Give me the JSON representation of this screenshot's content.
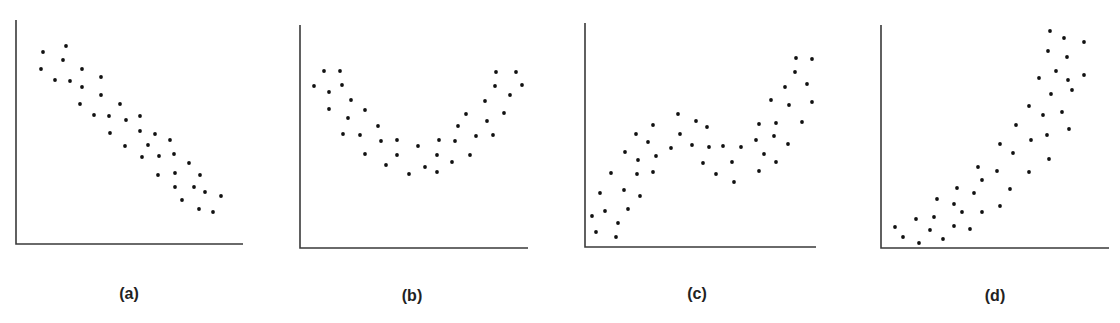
{
  "chart_data": [
    {
      "type": "scatter",
      "id": "a",
      "title": "",
      "label": "(a)",
      "xlabel": "",
      "ylabel": "",
      "grid": false,
      "legend": null,
      "pattern": "negative linear",
      "axis_origin_px": [
        16,
        244
      ],
      "axis_extent_px": [
        227,
        224
      ],
      "points": [
        [
          27,
          192
        ],
        [
          50,
          198
        ],
        [
          47,
          184
        ],
        [
          25,
          175
        ],
        [
          39,
          164
        ],
        [
          54,
          163
        ],
        [
          66,
          175
        ],
        [
          85,
          167
        ],
        [
          66,
          157
        ],
        [
          85,
          149
        ],
        [
          64,
          140
        ],
        [
          104,
          140
        ],
        [
          78,
          129
        ],
        [
          93,
          128
        ],
        [
          110,
          124
        ],
        [
          124,
          128
        ],
        [
          94,
          111
        ],
        [
          124,
          113
        ],
        [
          139,
          110
        ],
        [
          154,
          104
        ],
        [
          109,
          98
        ],
        [
          132,
          99
        ],
        [
          126,
          87
        ],
        [
          143,
          88
        ],
        [
          158,
          90
        ],
        [
          173,
          81
        ],
        [
          142,
          69
        ],
        [
          159,
          71
        ],
        [
          184,
          69
        ],
        [
          159,
          57
        ],
        [
          178,
          57
        ],
        [
          189,
          52
        ],
        [
          205,
          48
        ],
        [
          166,
          44
        ],
        [
          183,
          35
        ],
        [
          197,
          32
        ]
      ]
    },
    {
      "type": "scatter",
      "id": "b",
      "title": "",
      "label": "(b)",
      "xlabel": "",
      "ylabel": "",
      "grid": false,
      "legend": null,
      "pattern": "U-shaped (quadratic)",
      "axis_origin_px": [
        300,
        248
      ],
      "axis_extent_px": [
        228,
        223
      ],
      "points": [
        [
          14,
          162
        ],
        [
          24,
          177
        ],
        [
          40,
          177
        ],
        [
          29,
          156
        ],
        [
          42,
          163
        ],
        [
          29,
          139
        ],
        [
          51,
          148
        ],
        [
          48,
          130
        ],
        [
          65,
          138
        ],
        [
          43,
          114
        ],
        [
          60,
          113
        ],
        [
          78,
          122
        ],
        [
          81,
          107
        ],
        [
          65,
          94
        ],
        [
          97,
          108
        ],
        [
          97,
          93
        ],
        [
          86,
          83
        ],
        [
          109,
          74
        ],
        [
          118,
          102
        ],
        [
          125,
          81
        ],
        [
          139,
          108
        ],
        [
          137,
          93
        ],
        [
          137,
          76
        ],
        [
          152,
          86
        ],
        [
          155,
          107
        ],
        [
          158,
          122
        ],
        [
          166,
          134
        ],
        [
          170,
          93
        ],
        [
          176,
          112
        ],
        [
          185,
          147
        ],
        [
          187,
          127
        ],
        [
          193,
          113
        ],
        [
          195,
          162
        ],
        [
          196,
          176
        ],
        [
          204,
          135
        ],
        [
          210,
          153
        ],
        [
          216,
          176
        ],
        [
          222,
          163
        ]
      ]
    },
    {
      "type": "scatter",
      "id": "c",
      "title": "",
      "label": "(c)",
      "xlabel": "",
      "ylabel": "",
      "grid": false,
      "legend": null,
      "pattern": "cubic / S-shaped",
      "axis_origin_px": [
        585,
        247
      ],
      "axis_extent_px": [
        231,
        224
      ],
      "points": [
        [
          7,
          31
        ],
        [
          11,
          15
        ],
        [
          15,
          54
        ],
        [
          20,
          36
        ],
        [
          26,
          74
        ],
        [
          31,
          10
        ],
        [
          33,
          24
        ],
        [
          39,
          57
        ],
        [
          40,
          95
        ],
        [
          43,
          38
        ],
        [
          51,
          113
        ],
        [
          52,
          73
        ],
        [
          53,
          87
        ],
        [
          55,
          51
        ],
        [
          63,
          105
        ],
        [
          68,
          122
        ],
        [
          68,
          75
        ],
        [
          71,
          91
        ],
        [
          86,
          99
        ],
        [
          93,
          133
        ],
        [
          95,
          113
        ],
        [
          107,
          102
        ],
        [
          111,
          126
        ],
        [
          118,
          84
        ],
        [
          122,
          120
        ],
        [
          124,
          100
        ],
        [
          131,
          73
        ],
        [
          138,
          101
        ],
        [
          147,
          85
        ],
        [
          149,
          65
        ],
        [
          156,
          100
        ],
        [
          171,
          107
        ],
        [
          174,
          123
        ],
        [
          174,
          76
        ],
        [
          179,
          93
        ],
        [
          186,
          147
        ],
        [
          189,
          111
        ],
        [
          191,
          124
        ],
        [
          191,
          85
        ],
        [
          200,
          160
        ],
        [
          203,
          103
        ],
        [
          204,
          142
        ],
        [
          210,
          175
        ],
        [
          211,
          189
        ],
        [
          217,
          125
        ],
        [
          222,
          163
        ],
        [
          227,
          188
        ],
        [
          227,
          145
        ]
      ]
    },
    {
      "type": "scatter",
      "id": "d",
      "title": "",
      "label": "(d)",
      "xlabel": "",
      "ylabel": "",
      "grid": false,
      "legend": null,
      "pattern": "positive curvilinear (exponential-like)",
      "axis_origin_px": [
        881,
        248
      ],
      "axis_extent_px": [
        228,
        223
      ],
      "points": [
        [
          14,
          21
        ],
        [
          22,
          11
        ],
        [
          35,
          29
        ],
        [
          38,
          5
        ],
        [
          49,
          18
        ],
        [
          53,
          31
        ],
        [
          56,
          49
        ],
        [
          62,
          9
        ],
        [
          73,
          22
        ],
        [
          73,
          44
        ],
        [
          76,
          60
        ],
        [
          81,
          36
        ],
        [
          89,
          19
        ],
        [
          93,
          55
        ],
        [
          97,
          81
        ],
        [
          101,
          68
        ],
        [
          101,
          36
        ],
        [
          116,
          77
        ],
        [
          119,
          42
        ],
        [
          119,
          104
        ],
        [
          129,
          59
        ],
        [
          132,
          95
        ],
        [
          135,
          123
        ],
        [
          148,
          142
        ],
        [
          148,
          76
        ],
        [
          150,
          108
        ],
        [
          158,
          170
        ],
        [
          162,
          133
        ],
        [
          166,
          113
        ],
        [
          167,
          197
        ],
        [
          168,
          89
        ],
        [
          169,
          217
        ],
        [
          170,
          154
        ],
        [
          175,
          177
        ],
        [
          181,
          136
        ],
        [
          183,
          210
        ],
        [
          186,
          191
        ],
        [
          187,
          168
        ],
        [
          188,
          119
        ],
        [
          191,
          158
        ],
        [
          203,
          206
        ],
        [
          203,
          173
        ]
      ]
    }
  ],
  "colors": {
    "axis": "#3a3a3a",
    "dot": "#111111",
    "label": "#222222"
  }
}
